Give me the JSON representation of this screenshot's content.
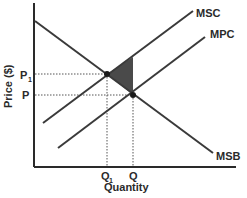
{
  "diagram": {
    "type": "economics-externality",
    "axes": {
      "y_label": "Price ($)",
      "x_label": "Quantity"
    },
    "curves": [
      {
        "name": "MSC",
        "label": "MSC"
      },
      {
        "name": "MPC",
        "label": "MPC"
      },
      {
        "name": "MSB",
        "label": "MSB"
      }
    ],
    "price_ticks": {
      "p1": "P",
      "p1_sub": "1",
      "p": "P"
    },
    "quantity_ticks": {
      "q1": "Q",
      "q1_sub": "1",
      "q": "Q"
    },
    "shaded_region": "deadweight-loss",
    "colors": {
      "line": "#3a3a3a",
      "shade": "#4a4a4a",
      "dots": "#1a1a1a"
    }
  }
}
